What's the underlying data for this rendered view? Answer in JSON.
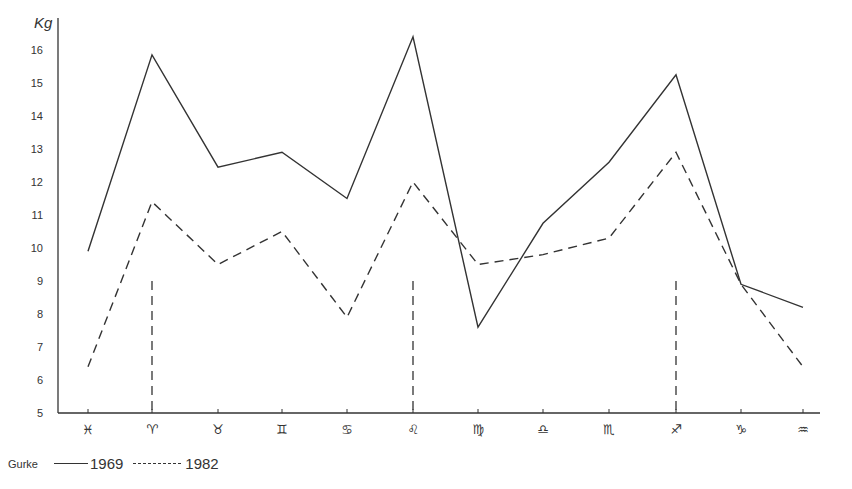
{
  "chart_data": {
    "type": "line",
    "title": "",
    "ylabel": "Kg",
    "xlabel": "",
    "ylim": [
      5,
      16.5
    ],
    "yticks": [
      5,
      6,
      7,
      8,
      9,
      10,
      11,
      12,
      13,
      14,
      15,
      16
    ],
    "grid": false,
    "legend_position": "bottom-left",
    "legend_title": "Gurke",
    "categories": [
      "♓",
      "♈",
      "♉",
      "♊",
      "♋",
      "♌",
      "♍",
      "♎",
      "♏",
      "♐",
      "♑",
      "♒"
    ],
    "category_names": [
      "Pisces",
      "Aries",
      "Taurus",
      "Gemini",
      "Cancer",
      "Leo",
      "Virgo",
      "Libra",
      "Scorpio",
      "Sagittarius",
      "Capricorn",
      "Aquarius"
    ],
    "series": [
      {
        "name": "1969",
        "style": "solid",
        "values": [
          9.9,
          15.85,
          12.45,
          12.9,
          11.5,
          16.4,
          7.6,
          10.75,
          12.6,
          15.25,
          8.9,
          8.2
        ]
      },
      {
        "name": "1982",
        "style": "dashed",
        "values": [
          6.4,
          11.4,
          9.5,
          10.5,
          7.9,
          12.0,
          9.5,
          9.8,
          10.3,
          12.9,
          8.9,
          6.4
        ]
      }
    ],
    "annotations": [
      {
        "type": "vertical-dashed-marker",
        "category": "♈",
        "from": 5,
        "to": 9
      },
      {
        "type": "vertical-dashed-marker",
        "category": "♌",
        "from": 5,
        "to": 9
      },
      {
        "type": "vertical-dashed-marker",
        "category": "♐",
        "from": 5,
        "to": 9
      }
    ]
  },
  "legend": {
    "title": "Gurke",
    "items": [
      {
        "label": "1969",
        "style": "solid"
      },
      {
        "label": "1982",
        "style": "dashed"
      }
    ]
  },
  "colors": {
    "line": "#333333",
    "background": "#ffffff"
  }
}
